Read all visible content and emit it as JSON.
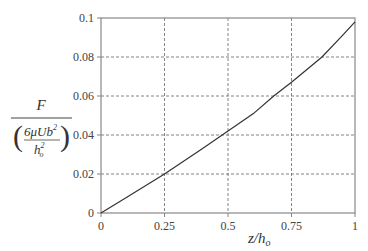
{
  "chart_data": {
    "type": "line",
    "title": "",
    "xlabel": "z/h_o",
    "ylabel": "F / (6μUb² / h_o²)",
    "xlim": [
      0,
      1
    ],
    "ylim": [
      0,
      0.1
    ],
    "grid": true,
    "legend": null,
    "x_ticks": [
      "0",
      "0.25",
      "0.5",
      "0.75",
      "1"
    ],
    "y_ticks": [
      "0",
      "0.02",
      "0.04",
      "0.06",
      "0.08",
      "0.1"
    ],
    "series": [
      {
        "name": "F",
        "x": [
          0,
          0.1,
          0.25,
          0.4,
          0.5,
          0.6,
          0.68,
          0.75,
          0.87,
          0.95,
          1.0
        ],
        "values": [
          0,
          0.008,
          0.02,
          0.033,
          0.042,
          0.051,
          0.06,
          0.067,
          0.08,
          0.091,
          0.098
        ]
      }
    ]
  },
  "labels": {
    "y_num": "F",
    "y_den_num": "6μUb",
    "y_den_sup": "2",
    "y_den_den": "h",
    "y_den_den_sub": "o",
    "y_den_den_sup": "2",
    "x_main": "z/h",
    "x_sub": "o"
  }
}
